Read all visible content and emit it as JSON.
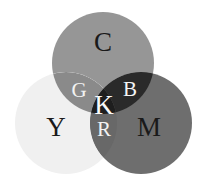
{
  "figure": {
    "kind": "venn-diagram",
    "background_color": "#ffffff",
    "width": 206,
    "height": 187
  },
  "circles": [
    {
      "id": "cyan",
      "label": "C",
      "fill": "#969696",
      "cx": 103,
      "cy": 63,
      "r": 51,
      "label_x": 103,
      "label_y": 45,
      "label_color": "#1a1a1a",
      "label_size": "primary"
    },
    {
      "id": "yellow",
      "label": "Y",
      "fill": "#f0f0f0",
      "cx": 66,
      "cy": 123,
      "r": 51,
      "label_x": 56,
      "label_y": 130,
      "label_color": "#1a1a1a",
      "label_size": "primary"
    },
    {
      "id": "magenta",
      "label": "M",
      "fill": "#6e6e6e",
      "cx": 141,
      "cy": 123,
      "r": 51,
      "label_x": 149,
      "label_y": 130,
      "label_color": "#1a1a1a",
      "label_size": "primary"
    }
  ],
  "intersections": [
    {
      "id": "green",
      "label": "G",
      "of": "cyan-yellow",
      "fill": "#8a8a8a",
      "label_x": 79,
      "label_y": 92,
      "label_color": "#f2f2f2",
      "label_size": "secondary"
    },
    {
      "id": "blue",
      "label": "B",
      "of": "cyan-magenta",
      "fill": "#2a2a2a",
      "label_x": 130,
      "label_y": 91,
      "label_color": "#f5f5f5",
      "label_size": "secondary"
    },
    {
      "id": "red",
      "label": "R",
      "of": "yellow-magenta",
      "fill": "#686868",
      "label_x": 104,
      "label_y": 131,
      "label_color": "#f2f2f2",
      "label_size": "secondary"
    },
    {
      "id": "black",
      "label": "K",
      "of": "cyan-magenta-yellow",
      "fill": "#1e1e1e",
      "label_x": 104,
      "label_y": 108,
      "label_color": "#fafafa",
      "label_size": "center"
    }
  ]
}
